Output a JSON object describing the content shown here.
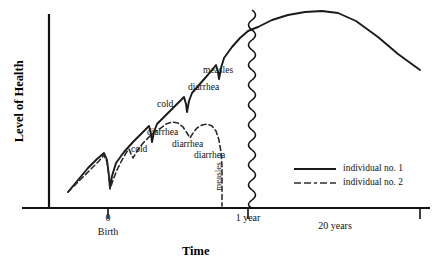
{
  "chart_data": {
    "type": "line",
    "title": "",
    "xlabel": "Time",
    "ylabel": "Level of Health",
    "grid": false,
    "legend_position": "right-middle",
    "xlim": [
      -0.25,
      21
    ],
    "ylim": [
      0,
      10
    ],
    "x_ticks": [
      {
        "label": "0",
        "sublabel": "Birth",
        "x_px": 108
      },
      {
        "label": "1 year",
        "sublabel": "",
        "x_px": 248
      },
      {
        "label": "20 years",
        "sublabel": "",
        "x_px": 334
      }
    ],
    "axis_break": {
      "label": "axis-break-squiggle",
      "x_px": 252,
      "note": "wavy vertical line marking a break in the time axis between 1 year and 20 years"
    },
    "series": [
      {
        "name": "individual no. 1",
        "style": "solid",
        "color": "#1a1a1a",
        "annotations": [
          {
            "label": "cold",
            "x_px": 160,
            "y_px": 105
          },
          {
            "label": "diarrhea",
            "x_px": 183,
            "y_px": 88
          },
          {
            "label": "measles",
            "x_px": 207,
            "y_px": 70
          }
        ],
        "points_px": [
          [
            68,
            192
          ],
          [
            78,
            180
          ],
          [
            88,
            168
          ],
          [
            97,
            159
          ],
          [
            104,
            153
          ],
          [
            107,
            160
          ],
          [
            109,
            176
          ],
          [
            110,
            188
          ],
          [
            112,
            176
          ],
          [
            116,
            163
          ],
          [
            124,
            152
          ],
          [
            133,
            142
          ],
          [
            142,
            133
          ],
          [
            149,
            126
          ],
          [
            151,
            134
          ],
          [
            152,
            142
          ],
          [
            154,
            132
          ],
          [
            157,
            124
          ],
          [
            165,
            116
          ],
          [
            173,
            108
          ],
          [
            180,
            101
          ],
          [
            184,
            97
          ],
          [
            186,
            104
          ],
          [
            187,
            112
          ],
          [
            189,
            101
          ],
          [
            192,
            93
          ],
          [
            199,
            85
          ],
          [
            206,
            77
          ],
          [
            212,
            70
          ],
          [
            216,
            65
          ],
          [
            218,
            72
          ],
          [
            219,
            79
          ],
          [
            221,
            68
          ],
          [
            224,
            58
          ],
          [
            232,
            47
          ],
          [
            240,
            38
          ],
          [
            248,
            31
          ],
          [
            258,
            27
          ],
          [
            272,
            20
          ],
          [
            288,
            15
          ],
          [
            305,
            12
          ],
          [
            322,
            11
          ],
          [
            338,
            13
          ],
          [
            356,
            21
          ],
          [
            378,
            37
          ],
          [
            398,
            54
          ],
          [
            420,
            70
          ]
        ]
      },
      {
        "name": "individual no. 2",
        "style": "dashed",
        "color": "#2b2b2b",
        "annotations": [
          {
            "label": "cold",
            "x_px": 140,
            "y_px": 150
          },
          {
            "label": "diarrhea",
            "x_px": 163,
            "y_px": 134
          },
          {
            "label": "diarrhea",
            "x_px": 192,
            "y_px": 146
          },
          {
            "label": "diarrhea",
            "x_px": 213,
            "y_px": 156
          },
          {
            "label": "measles",
            "x_px": 217,
            "y_px": 190,
            "rotated": true
          }
        ],
        "points_px": [
          [
            68,
            192
          ],
          [
            80,
            180
          ],
          [
            90,
            170
          ],
          [
            99,
            161
          ],
          [
            104,
            155
          ],
          [
            107,
            162
          ],
          [
            109,
            177
          ],
          [
            110,
            189
          ],
          [
            113,
            180
          ],
          [
            117,
            170
          ],
          [
            122,
            160
          ],
          [
            126,
            153
          ],
          [
            129,
            149
          ],
          [
            131,
            154
          ],
          [
            133,
            158
          ],
          [
            136,
            153
          ],
          [
            139,
            148
          ],
          [
            144,
            142
          ],
          [
            150,
            136
          ],
          [
            156,
            131
          ],
          [
            161,
            128
          ],
          [
            166,
            124
          ],
          [
            172,
            122
          ],
          [
            178,
            123
          ],
          [
            183,
            127
          ],
          [
            187,
            133
          ],
          [
            190,
            138
          ],
          [
            193,
            133
          ],
          [
            197,
            128
          ],
          [
            202,
            125
          ],
          [
            207,
            124
          ],
          [
            212,
            126
          ],
          [
            216,
            131
          ],
          [
            219,
            140
          ],
          [
            221,
            152
          ],
          [
            222,
            166
          ],
          [
            222,
            182
          ],
          [
            222,
            196
          ],
          [
            222,
            206
          ]
        ]
      }
    ],
    "legend": [
      {
        "label": "individual no. 1",
        "style": "solid"
      },
      {
        "label": "individual no. 2",
        "style": "dashed"
      }
    ]
  },
  "axis": {
    "y_title": "Level of Health",
    "x_title": "Time"
  },
  "ticks": {
    "birth_value": "0",
    "birth_label": "Birth",
    "one_year": "1 year",
    "twenty_years": "20 years"
  },
  "annotations": {
    "s1_cold": "cold",
    "s1_diarrhea": "diarrhea",
    "s1_measles": "measles",
    "s2_cold": "cold",
    "s2_diarrhea_1": "diarrhea",
    "s2_diarrhea_2": "diarrhea",
    "s2_diarrhea_3": "diarrhea",
    "s2_measles": "measles"
  },
  "legend": {
    "item_1": "individual no. 1",
    "item_2": "individual no. 2"
  }
}
